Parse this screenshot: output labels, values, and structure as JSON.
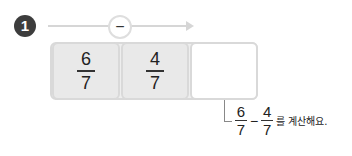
{
  "problem": {
    "number": "1",
    "operator_symbol": "−",
    "operator_icon": "minus-circle-icon",
    "cells": [
      {
        "numerator": "6",
        "denominator": "7"
      },
      {
        "numerator": "4",
        "denominator": "7"
      },
      {
        "numerator": "",
        "denominator": ""
      }
    ],
    "note": {
      "a_num": "6",
      "a_den": "7",
      "op": "−",
      "b_num": "4",
      "b_den": "7",
      "text": "를 계산해요."
    }
  },
  "colors": {
    "badge": "#3d3d3d",
    "cell_fill": "#e9e9e9",
    "cell_border": "#d9d9d9",
    "arrow": "#d6d6d6"
  }
}
